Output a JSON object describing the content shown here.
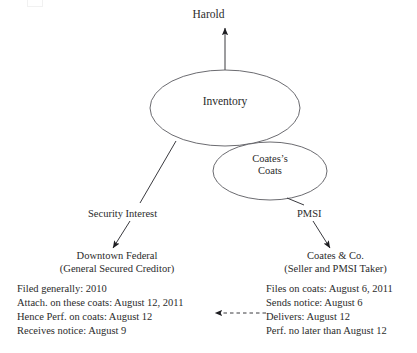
{
  "diagram": {
    "top_node": {
      "label": "Harold"
    },
    "ellipses": {
      "inventory": {
        "label": "Inventory"
      },
      "coats": {
        "label_line1": "Coates’s",
        "label_line2": "Coats"
      }
    },
    "edge_labels": {
      "security_interest": "Security Interest",
      "pmsi": "PMSI"
    },
    "left_party": {
      "name": "Downtown Federal",
      "role": "(General Secured Creditor)",
      "facts": [
        "Filed generally: 2010",
        "Attach. on these coats: August 12, 2011",
        "Hence Perf. on coats: August 12",
        "Receives notice: August 9"
      ]
    },
    "right_party": {
      "name": "Coates & Co.",
      "role": "(Seller and PMSI Taker)",
      "facts": [
        "Files on coats: August 6, 2011",
        "Sends notice: August 6",
        "Delivers: August 12",
        "Perf. no later than August 12"
      ]
    },
    "colors": {
      "ink": "#2b2b2b",
      "stroke": "#3a3a3f",
      "ellipse_stroke": "#5a5a60",
      "background": "#ffffff"
    }
  }
}
